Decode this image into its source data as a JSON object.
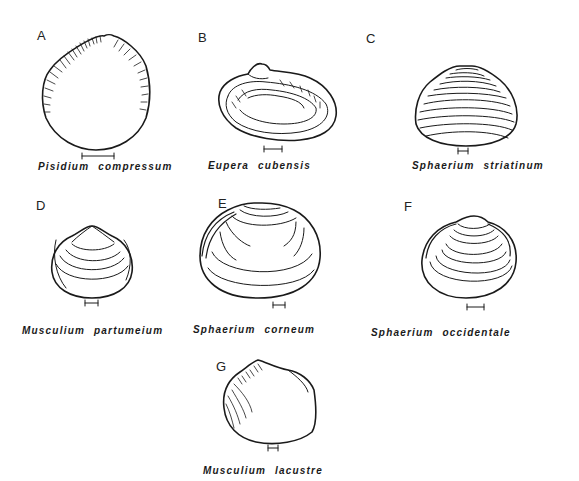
{
  "figure": {
    "panels": [
      {
        "letter": "A",
        "species": "Pisidium compressum"
      },
      {
        "letter": "B",
        "species": "Eupera cubensis"
      },
      {
        "letter": "C",
        "species": "Sphaerium striatinum"
      },
      {
        "letter": "D",
        "species": "Musculium partumeium"
      },
      {
        "letter": "E",
        "species": "Sphaerium corneum"
      },
      {
        "letter": "F",
        "species": "Sphaerium occidentale"
      },
      {
        "letter": "G",
        "species": "Musculium lacustre"
      }
    ],
    "scale_bar_icon": "scale-bar",
    "colors": {
      "ink": "#1a1a1a",
      "background": "#ffffff"
    }
  }
}
